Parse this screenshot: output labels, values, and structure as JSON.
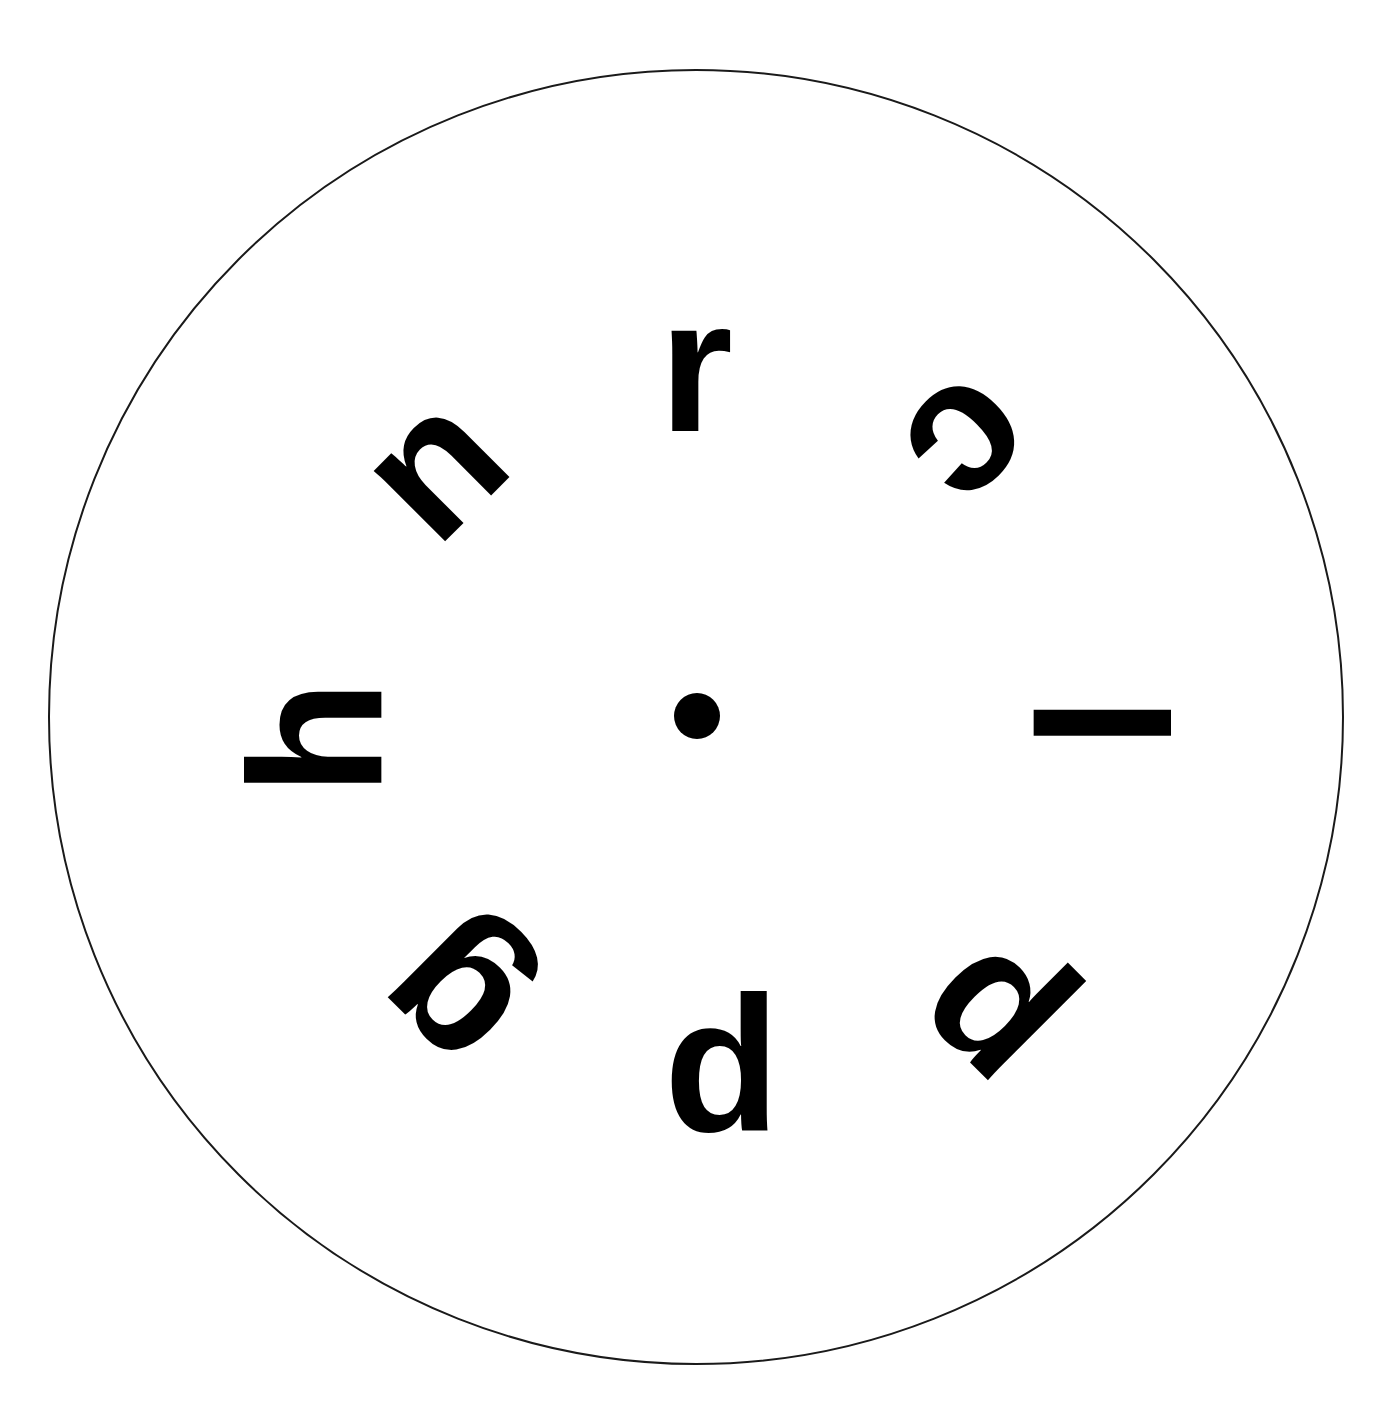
{
  "canvas": {
    "width": 1399,
    "height": 1406,
    "background_color": "#ffffff",
    "description": "Radial letter chart: eight bold lowercase letters arranged evenly around a central fixation dot inside a thin circular outline."
  },
  "circle": {
    "center_x": 696,
    "center_y": 717,
    "radius": 648,
    "stroke_color": "#1a1a1a",
    "stroke_width": 2,
    "fill": "none"
  },
  "center_dot": {
    "center_x": 697,
    "center_y": 716,
    "diameter": 46,
    "color": "#000000",
    "label": "fixation-dot"
  },
  "letters": {
    "ink_color": "#000000",
    "font_weight": "bold",
    "font_size_px": 190,
    "orbit_radius": 352,
    "items": [
      {
        "char": "r",
        "angle_deg": 0,
        "position": "top",
        "clock_position": "12 o'clock",
        "rotation_deg": 0,
        "center_x": 696,
        "center_y": 365,
        "orbit_radius": 352
      },
      {
        "char": "c",
        "angle_deg": 45,
        "position": "upper-right",
        "clock_position": "1:30",
        "rotation_deg": 135,
        "center_x": 975,
        "center_y": 448,
        "orbit_radius": 352
      },
      {
        "char": "l",
        "angle_deg": 90,
        "position": "right",
        "clock_position": "3 o'clock",
        "rotation_deg": 90,
        "center_x": 1100,
        "center_y": 723,
        "orbit_radius": 352
      },
      {
        "char": "p",
        "angle_deg": 135,
        "position": "lower-right",
        "clock_position": "4:30",
        "rotation_deg": 225,
        "center_x": 980,
        "center_y": 1024,
        "orbit_radius": 352
      },
      {
        "char": "p",
        "angle_deg": 180,
        "position": "bottom",
        "clock_position": "6 o'clock",
        "rotation_deg": 180,
        "center_x": 722,
        "center_y": 1096,
        "orbit_radius": 352
      },
      {
        "char": "g",
        "angle_deg": 225,
        "position": "lower-left",
        "clock_position": "7:30",
        "rotation_deg": 225,
        "center_x": 444,
        "center_y": 1005,
        "orbit_radius": 352
      },
      {
        "char": "h",
        "angle_deg": 270,
        "position": "left",
        "clock_position": "9 o'clock",
        "rotation_deg": 270,
        "center_x": 315,
        "center_y": 738,
        "orbit_radius": 352
      },
      {
        "char": "n",
        "angle_deg": 315,
        "position": "upper-left",
        "clock_position": "10:30",
        "rotation_deg": 315,
        "center_x": 430,
        "center_y": 463,
        "orbit_radius": 352
      }
    ],
    "reading_clockwise_from_top": "r c l p p g h n"
  },
  "chart_data": {
    "type": "scatter",
    "title": "",
    "subtitle": "",
    "xlabel": "",
    "ylabel": "",
    "grid": false,
    "legend": null,
    "coordinate_system": "polar",
    "angle_unit": "degrees",
    "angle_zero_at": "top (12 o'clock)",
    "angle_direction": "clockwise",
    "xlim": [
      0,
      1399
    ],
    "ylim": [
      0,
      1406
    ],
    "center": [
      696,
      717
    ],
    "boundary_radius": 648,
    "categories": [
      "r",
      "c",
      "l",
      "p",
      "p",
      "g",
      "h",
      "n"
    ],
    "values": [
      352,
      352,
      352,
      352,
      352,
      352,
      352,
      352
    ],
    "series": [
      {
        "name": "letter angle (deg)",
        "values": [
          0,
          45,
          90,
          135,
          180,
          225,
          270,
          315
        ]
      },
      {
        "name": "glyph rotation (deg)",
        "values": [
          0,
          135,
          90,
          225,
          180,
          225,
          270,
          315
        ]
      },
      {
        "name": "orbit radius (px)",
        "values": [
          352,
          352,
          352,
          352,
          352,
          352,
          352,
          352
        ]
      }
    ],
    "annotations": [
      {
        "text": "r",
        "angle_deg": 0,
        "radius": 352
      },
      {
        "text": "c",
        "angle_deg": 45,
        "radius": 352
      },
      {
        "text": "l",
        "angle_deg": 90,
        "radius": 352
      },
      {
        "text": "p",
        "angle_deg": 135,
        "radius": 352
      },
      {
        "text": "p",
        "angle_deg": 180,
        "radius": 352
      },
      {
        "text": "g",
        "angle_deg": 225,
        "radius": 352
      },
      {
        "text": "h",
        "angle_deg": 270,
        "radius": 352
      },
      {
        "text": "n",
        "angle_deg": 315,
        "radius": 352
      }
    ]
  }
}
